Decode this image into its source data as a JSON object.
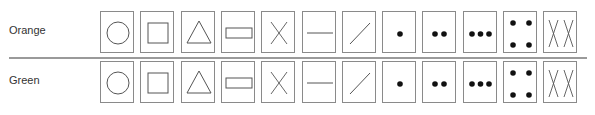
{
  "rows": [
    {
      "label": "Orange",
      "top": 11
    },
    {
      "label": "Green",
      "top": 61
    }
  ],
  "symbols": [
    {
      "name": "circle"
    },
    {
      "name": "square"
    },
    {
      "name": "triangle"
    },
    {
      "name": "rectangle"
    },
    {
      "name": "x-cross"
    },
    {
      "name": "horizontal-line"
    },
    {
      "name": "diagonal-line"
    },
    {
      "name": "one-dot"
    },
    {
      "name": "two-dots"
    },
    {
      "name": "three-dots"
    },
    {
      "name": "four-dots"
    },
    {
      "name": "double-x"
    }
  ],
  "colors": {
    "stroke": "#555555",
    "border": "#8a8a8a",
    "dot": "#111111",
    "divider": "#9a9a9a"
  }
}
